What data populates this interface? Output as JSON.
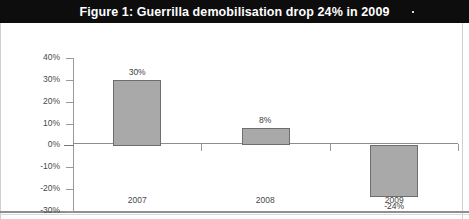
{
  "figure": {
    "title": "Figure 1: Guerrilla demobilisation drop 24% in 2009"
  },
  "chart_data": {
    "type": "bar",
    "title": "Figure 1: Guerrilla demobilisation drop 24% in 2009",
    "xlabel": "",
    "ylabel": "",
    "categories": [
      "2007",
      "2008",
      "2009"
    ],
    "values": [
      30,
      8,
      -24
    ],
    "data_labels": [
      "30%",
      "8%",
      "-24%"
    ],
    "ylim": [
      -30,
      40
    ],
    "ytick_values": [
      40,
      30,
      20,
      10,
      0,
      -10,
      -20,
      -30
    ],
    "ytick_labels": [
      "40%",
      "30%",
      "20%",
      "10%",
      "0%",
      "-10%",
      "-20%",
      "-30%"
    ],
    "grid": false,
    "legend": false,
    "series": [
      {
        "name": "Guerrilla demobilisation change",
        "values": [
          30,
          8,
          -24
        ]
      }
    ],
    "colors": {
      "bar_fill": "#a9a9a9",
      "bar_border": "#6e6e6e",
      "axis": "#9a9a9a",
      "title_band": "#0d0d0d",
      "title_text": "#ffffff"
    }
  }
}
